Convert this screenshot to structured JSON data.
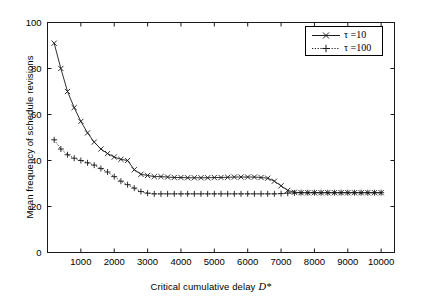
{
  "chart_data": {
    "type": "line",
    "title": "",
    "xlabel": "Critical cumulative delay",
    "xlabel_symbol": "D*",
    "ylabel": "Mean frequency of schedule revisions",
    "xlim": [
      0,
      10400
    ],
    "ylim": [
      0,
      100
    ],
    "xticks": [
      1000,
      2000,
      3000,
      4000,
      5000,
      6000,
      7000,
      8000,
      9000,
      10000
    ],
    "yticks": [
      0,
      20,
      40,
      60,
      80,
      100
    ],
    "grid": false,
    "legend_position": "top-right",
    "series": [
      {
        "name": "tau =10",
        "legend_label": "τ =10",
        "linestyle": "solid",
        "marker": "x",
        "color": "#1a1a1a",
        "x": [
          200,
          400,
          600,
          800,
          1000,
          1200,
          1400,
          1600,
          1800,
          2000,
          2200,
          2400,
          2600,
          2800,
          3000,
          3200,
          3400,
          3600,
          3800,
          4000,
          4200,
          4400,
          4600,
          4800,
          5000,
          5200,
          5400,
          5600,
          5800,
          6000,
          6200,
          6400,
          6600,
          6800,
          7000,
          7200,
          7400,
          7600,
          7800,
          8000,
          8200,
          8400,
          8600,
          8800,
          9000,
          9200,
          9400,
          9600,
          9800,
          10000
        ],
        "y": [
          91,
          80,
          70,
          63,
          57,
          52,
          48,
          45,
          43,
          41.5,
          40.5,
          40,
          36,
          34,
          33.5,
          33,
          33,
          32.8,
          32.6,
          32.6,
          32.5,
          32.5,
          32.5,
          32.5,
          32.6,
          32.6,
          32.7,
          32.8,
          32.8,
          32.8,
          32.8,
          32.6,
          32.3,
          31,
          29,
          27,
          26.2,
          26,
          26,
          26,
          26,
          26,
          26,
          26,
          26,
          26,
          26,
          26,
          26,
          26
        ]
      },
      {
        "name": "tau =100",
        "legend_label": "τ =100",
        "linestyle": "dotted",
        "marker": "+",
        "color": "#1a1a1a",
        "x": [
          200,
          400,
          600,
          800,
          1000,
          1200,
          1400,
          1600,
          1800,
          2000,
          2200,
          2400,
          2600,
          2800,
          3000,
          3200,
          3400,
          3600,
          3800,
          4000,
          4200,
          4400,
          4600,
          4800,
          5000,
          5200,
          5400,
          5600,
          5800,
          6000,
          6200,
          6400,
          6600,
          6800,
          7000,
          7200,
          7400,
          7600,
          7800,
          8000,
          8200,
          8400,
          8600,
          8800,
          9000,
          9200,
          9400,
          9600,
          9800,
          10000
        ],
        "y": [
          49,
          45,
          42.5,
          41,
          40,
          39,
          38,
          36.5,
          35,
          33,
          31,
          29.5,
          28,
          26.5,
          25.8,
          25.5,
          25.5,
          25.5,
          25.5,
          25.5,
          25.5,
          25.5,
          25.5,
          25.5,
          25.5,
          25.5,
          25.5,
          25.5,
          25.5,
          25.5,
          25.5,
          25.5,
          25.5,
          25.5,
          25.6,
          25.8,
          25.9,
          26,
          26,
          26,
          26,
          26,
          26,
          26,
          26,
          26,
          26,
          26,
          26,
          26
        ]
      }
    ]
  },
  "axes": {
    "xtick_labels": [
      "1000",
      "2000",
      "3000",
      "4000",
      "5000",
      "6000",
      "7000",
      "8000",
      "9000",
      "10000"
    ],
    "ytick_labels": [
      "0",
      "20",
      "40",
      "60",
      "80",
      "100"
    ]
  },
  "legend": {
    "items": [
      {
        "label": "τ =10"
      },
      {
        "label": "τ =100"
      }
    ]
  },
  "colors": {
    "axis": "#1a1a1a",
    "series": "#1a1a1a",
    "background": "#ffffff"
  }
}
